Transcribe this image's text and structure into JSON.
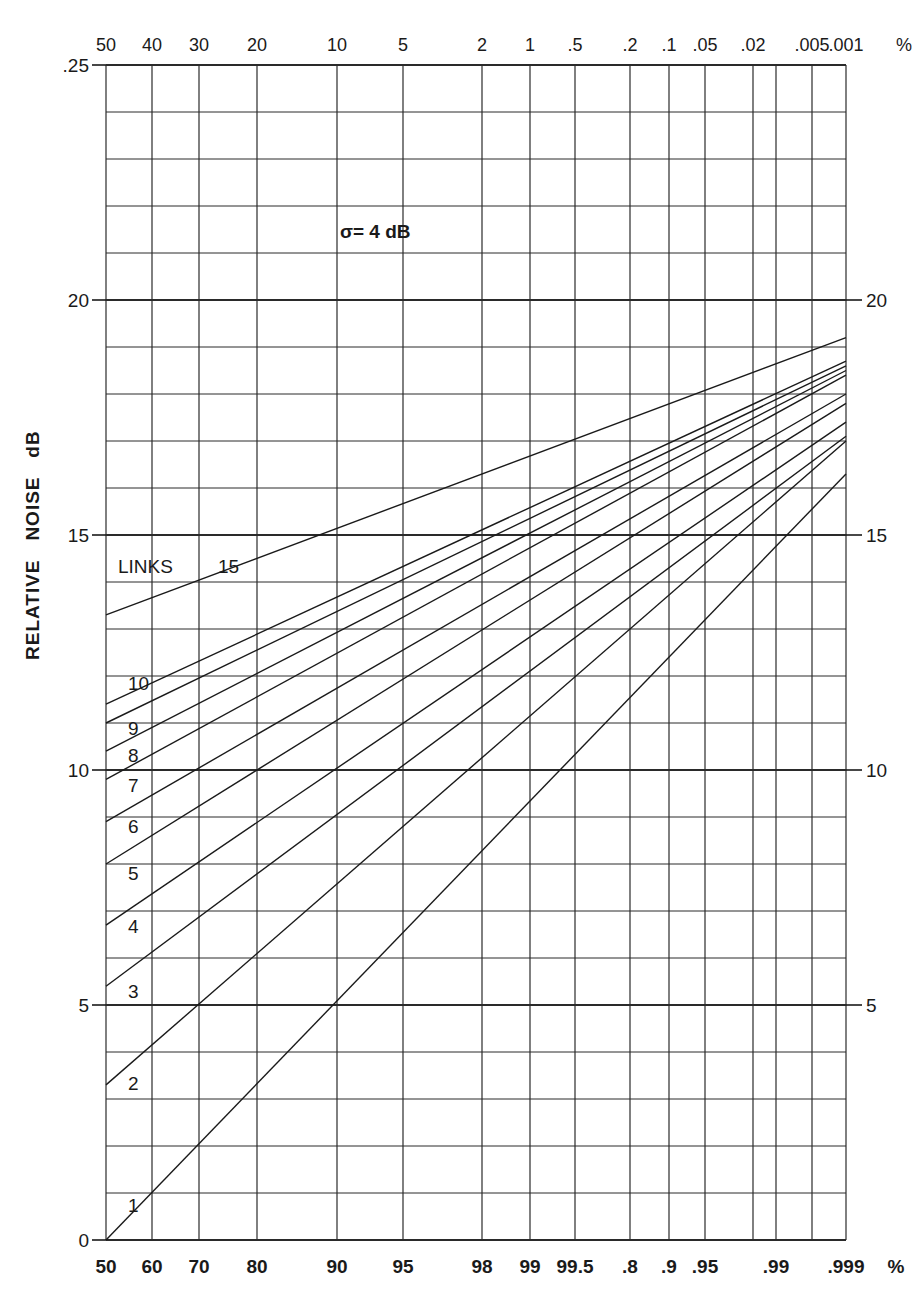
{
  "chart_data": {
    "type": "line",
    "annotation": "σ= 4 dB",
    "ylabel": "RELATIVE   NOISE   dB",
    "xlabel_bottom_unit": "%",
    "xlabel_top_unit": "%",
    "ylim": [
      0,
      25
    ],
    "y_ticks_left": [
      "0",
      "5",
      "10",
      "15",
      "20",
      "25"
    ],
    "y_ticks_right": [
      "5",
      "10",
      "15",
      "20"
    ],
    "x_scale": "normal probability",
    "x_bottom_ticks": [
      "50",
      "60",
      "70",
      "80",
      "90",
      "95",
      "98",
      "99",
      "99.5",
      ".8",
      ".9",
      ".95",
      ".99",
      ".999"
    ],
    "x_bottom_values": [
      50,
      60,
      70,
      80,
      90,
      95,
      98,
      99,
      99.5,
      99.8,
      99.9,
      99.95,
      99.99,
      99.999
    ],
    "x_top_ticks": [
      "50",
      "40",
      "30",
      "20",
      "10",
      "5",
      "2",
      "1",
      ".5",
      ".2",
      ".1",
      ".05",
      ".02",
      ".005",
      ".001"
    ],
    "x_top_values": [
      50,
      40,
      30,
      20,
      10,
      5,
      2,
      1,
      0.5,
      0.2,
      0.1,
      0.05,
      0.02,
      0.005,
      0.001
    ],
    "grid": true,
    "legend_label": "LINKS",
    "series": [
      {
        "name": "15",
        "x": [
          50,
          99.999
        ],
        "values": [
          13.3,
          19.2
        ]
      },
      {
        "name": "10",
        "x": [
          50,
          99.999
        ],
        "values": [
          11.4,
          18.7
        ]
      },
      {
        "name": "9",
        "x": [
          50,
          99.999
        ],
        "values": [
          11.0,
          18.6
        ]
      },
      {
        "name": "8",
        "x": [
          50,
          99.999
        ],
        "values": [
          10.4,
          18.5
        ]
      },
      {
        "name": "7",
        "x": [
          50,
          99.999
        ],
        "values": [
          9.8,
          18.4
        ]
      },
      {
        "name": "6",
        "x": [
          50,
          99.999
        ],
        "values": [
          8.9,
          18.0
        ]
      },
      {
        "name": "5",
        "x": [
          50,
          99.999
        ],
        "values": [
          8.0,
          17.8
        ]
      },
      {
        "name": "4",
        "x": [
          50,
          99.999
        ],
        "values": [
          6.7,
          17.4
        ]
      },
      {
        "name": "3",
        "x": [
          50,
          99.999
        ],
        "values": [
          5.4,
          17.1
        ]
      },
      {
        "name": "2",
        "x": [
          50,
          99.999
        ],
        "values": [
          3.3,
          17.0
        ]
      },
      {
        "name": "1",
        "x": [
          50,
          99.999
        ],
        "values": [
          0.0,
          16.3
        ]
      }
    ]
  },
  "layout": {
    "plot_left": 106,
    "plot_right": 846,
    "plot_top": 65,
    "plot_bottom": 1240,
    "grid_x": [
      106,
      152,
      199,
      257,
      337,
      403,
      482,
      530,
      575,
      630,
      669,
      705,
      753,
      776,
      812,
      846
    ],
    "bottom_tick_x": [
      106,
      152,
      199,
      257,
      337,
      403,
      482,
      530,
      575,
      630,
      669,
      705,
      776,
      846
    ],
    "top_tick_x": [
      106,
      152,
      199,
      257,
      337,
      403,
      482,
      530,
      575,
      630,
      669,
      705,
      753,
      812,
      846
    ],
    "series_label_pos": {
      "15": [
        218,
        573
      ],
      "10": [
        128,
        690
      ],
      "9": [
        128,
        735
      ],
      "8": [
        128,
        762
      ],
      "7": [
        128,
        792
      ],
      "6": [
        128,
        833
      ],
      "5": [
        128,
        880
      ],
      "4": [
        128,
        933
      ],
      "3": [
        128,
        998
      ],
      "2": [
        128,
        1090
      ],
      "1": [
        128,
        1212
      ]
    },
    "legend_pos": [
      118,
      573
    ],
    "annotation_pos": [
      340,
      238
    ]
  },
  "colors": {
    "ink": "#1a1a1a",
    "grid": "#2a2a2a",
    "background": "#ffffff"
  }
}
